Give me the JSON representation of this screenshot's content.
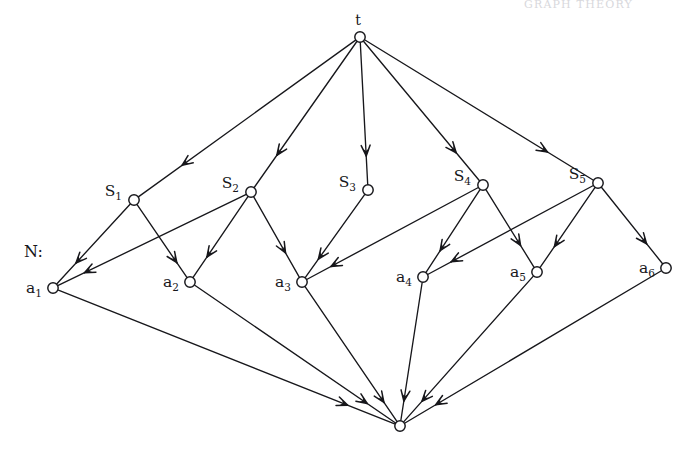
{
  "figure": {
    "caption_label": "N:",
    "page_header": "GRAPH THEORY",
    "background_color": "#ffffff",
    "ink_color": "#17171b",
    "node_radius": 5.2,
    "nodes": [
      {
        "id": "t",
        "label": "t",
        "sub": "",
        "x": 360,
        "y": 37,
        "label_dx": -2,
        "label_dy": -12,
        "anchor": "middle",
        "italic": true
      },
      {
        "id": "S1",
        "label": "S",
        "sub": "1",
        "x": 134,
        "y": 200,
        "label_dx": -12,
        "label_dy": -4,
        "anchor": "end",
        "italic": false
      },
      {
        "id": "S2",
        "label": "S",
        "sub": "2",
        "x": 251,
        "y": 192,
        "label_dx": -12,
        "label_dy": -4,
        "anchor": "end",
        "italic": false
      },
      {
        "id": "S3",
        "label": "S",
        "sub": "3",
        "x": 368,
        "y": 190,
        "label_dx": -12,
        "label_dy": -3,
        "anchor": "end",
        "italic": false
      },
      {
        "id": "S4",
        "label": "S",
        "sub": "4",
        "x": 483,
        "y": 185,
        "label_dx": -12,
        "label_dy": -4,
        "anchor": "end",
        "italic": false
      },
      {
        "id": "S5",
        "label": "S",
        "sub": "5",
        "x": 598,
        "y": 183,
        "label_dx": -12,
        "label_dy": -4,
        "anchor": "end",
        "italic": false
      },
      {
        "id": "a1",
        "label": "a",
        "sub": "1",
        "x": 53,
        "y": 288,
        "label_dx": -11,
        "label_dy": 5,
        "anchor": "end",
        "italic": true
      },
      {
        "id": "a2",
        "label": "a",
        "sub": "2",
        "x": 190,
        "y": 282,
        "label_dx": -11,
        "label_dy": 5,
        "anchor": "end",
        "italic": true
      },
      {
        "id": "a3",
        "label": "a",
        "sub": "3",
        "x": 302,
        "y": 282,
        "label_dx": -11,
        "label_dy": 5,
        "anchor": "end",
        "italic": true
      },
      {
        "id": "a4",
        "label": "a",
        "sub": "4",
        "x": 423,
        "y": 277,
        "label_dx": -11,
        "label_dy": 5,
        "anchor": "end",
        "italic": true
      },
      {
        "id": "a5",
        "label": "a",
        "sub": "5",
        "x": 537,
        "y": 272,
        "label_dx": -11,
        "label_dy": 5,
        "anchor": "end",
        "italic": true
      },
      {
        "id": "a6",
        "label": "a",
        "sub": "6",
        "x": 666,
        "y": 268,
        "label_dx": -11,
        "label_dy": 5,
        "anchor": "end",
        "italic": true
      },
      {
        "id": "sink",
        "label": "",
        "sub": "",
        "x": 400,
        "y": 426,
        "label_dx": 0,
        "label_dy": 0,
        "anchor": "middle",
        "italic": false
      }
    ],
    "edges": [
      {
        "from": "t",
        "to": "S1",
        "arrow_at": 0.8
      },
      {
        "from": "t",
        "to": "S2",
        "arrow_at": 0.78
      },
      {
        "from": "t",
        "to": "S3",
        "arrow_at": 0.8
      },
      {
        "from": "t",
        "to": "S4",
        "arrow_at": 0.8
      },
      {
        "from": "t",
        "to": "S5",
        "arrow_at": 0.8
      },
      {
        "from": "S1",
        "to": "a1",
        "arrow_at": 0.74
      },
      {
        "from": "S1",
        "to": "a2",
        "arrow_at": 0.8
      },
      {
        "from": "S2",
        "to": "a1",
        "arrow_at": 0.86
      },
      {
        "from": "S2",
        "to": "a2",
        "arrow_at": 0.75
      },
      {
        "from": "S2",
        "to": "a3",
        "arrow_at": 0.7
      },
      {
        "from": "S3",
        "to": "a3",
        "arrow_at": 0.78
      },
      {
        "from": "S4",
        "to": "a3",
        "arrow_at": 0.86
      },
      {
        "from": "S4",
        "to": "a4",
        "arrow_at": 0.74
      },
      {
        "from": "S4",
        "to": "a5",
        "arrow_at": 0.72
      },
      {
        "from": "S5",
        "to": "a4",
        "arrow_at": 0.86
      },
      {
        "from": "S5",
        "to": "a5",
        "arrow_at": 0.74
      },
      {
        "from": "S5",
        "to": "a6",
        "arrow_at": 0.74
      },
      {
        "from": "a1",
        "to": "sink",
        "arrow_at": 0.86
      },
      {
        "from": "a2",
        "to": "sink",
        "arrow_at": 0.86
      },
      {
        "from": "a3",
        "to": "sink",
        "arrow_at": 0.86
      },
      {
        "from": "a4",
        "to": "sink",
        "arrow_at": 0.86
      },
      {
        "from": "a5",
        "to": "sink",
        "arrow_at": 0.86
      },
      {
        "from": "a6",
        "to": "sink",
        "arrow_at": 0.88
      }
    ],
    "caption_position": {
      "x": 24,
      "y": 257
    }
  }
}
